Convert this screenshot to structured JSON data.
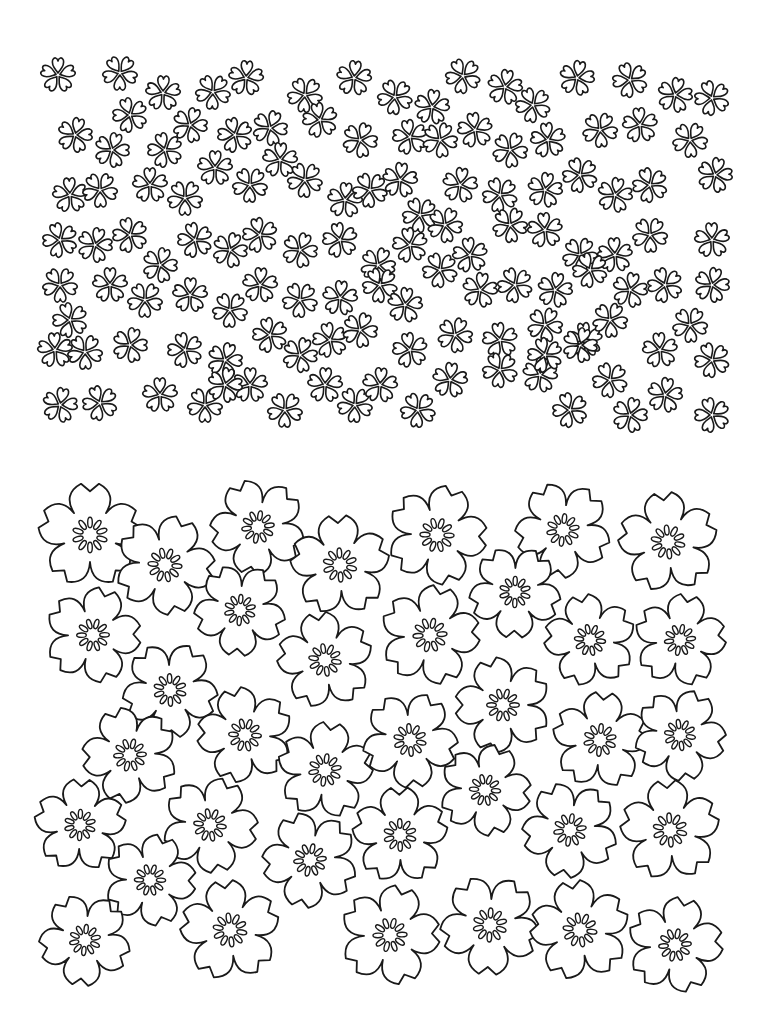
{
  "page": {
    "width": 770,
    "height": 1033,
    "background": "#ffffff",
    "stroke": "#1a1a1a"
  },
  "small_blossoms": {
    "region": {
      "x": 35,
      "y": 55,
      "width": 700,
      "height": 385
    },
    "size": 17,
    "positions": [
      [
        58,
        75
      ],
      [
        120,
        73
      ],
      [
        163,
        93
      ],
      [
        213,
        92
      ],
      [
        246,
        78
      ],
      [
        305,
        95
      ],
      [
        354,
        78
      ],
      [
        395,
        97
      ],
      [
        432,
        107
      ],
      [
        463,
        76
      ],
      [
        505,
        87
      ],
      [
        533,
        105
      ],
      [
        577,
        78
      ],
      [
        630,
        80
      ],
      [
        675,
        95
      ],
      [
        712,
        98
      ],
      [
        75,
        135
      ],
      [
        130,
        115
      ],
      [
        112,
        150
      ],
      [
        165,
        150
      ],
      [
        190,
        125
      ],
      [
        235,
        135
      ],
      [
        270,
        128
      ],
      [
        320,
        120
      ],
      [
        360,
        140
      ],
      [
        410,
        137
      ],
      [
        440,
        140
      ],
      [
        475,
        130
      ],
      [
        510,
        150
      ],
      [
        548,
        140
      ],
      [
        600,
        130
      ],
      [
        640,
        125
      ],
      [
        690,
        140
      ],
      [
        70,
        195
      ],
      [
        100,
        190
      ],
      [
        150,
        185
      ],
      [
        185,
        198
      ],
      [
        215,
        168
      ],
      [
        250,
        185
      ],
      [
        280,
        160
      ],
      [
        305,
        180
      ],
      [
        345,
        200
      ],
      [
        370,
        190
      ],
      [
        400,
        180
      ],
      [
        420,
        215
      ],
      [
        460,
        185
      ],
      [
        500,
        195
      ],
      [
        545,
        190
      ],
      [
        580,
        175
      ],
      [
        615,
        195
      ],
      [
        650,
        185
      ],
      [
        715,
        175
      ],
      [
        60,
        240
      ],
      [
        95,
        245
      ],
      [
        130,
        235
      ],
      [
        160,
        265
      ],
      [
        195,
        240
      ],
      [
        230,
        250
      ],
      [
        260,
        235
      ],
      [
        300,
        250
      ],
      [
        340,
        240
      ],
      [
        378,
        265
      ],
      [
        410,
        245
      ],
      [
        445,
        225
      ],
      [
        470,
        255
      ],
      [
        510,
        225
      ],
      [
        545,
        230
      ],
      [
        580,
        255
      ],
      [
        615,
        255
      ],
      [
        650,
        235
      ],
      [
        712,
        240
      ],
      [
        60,
        285
      ],
      [
        110,
        285
      ],
      [
        145,
        300
      ],
      [
        190,
        295
      ],
      [
        230,
        310
      ],
      [
        260,
        285
      ],
      [
        300,
        300
      ],
      [
        340,
        298
      ],
      [
        380,
        285
      ],
      [
        405,
        305
      ],
      [
        440,
        270
      ],
      [
        480,
        290
      ],
      [
        515,
        285
      ],
      [
        555,
        290
      ],
      [
        590,
        270
      ],
      [
        630,
        290
      ],
      [
        665,
        285
      ],
      [
        712,
        285
      ],
      [
        70,
        320
      ],
      [
        130,
        345
      ],
      [
        185,
        350
      ],
      [
        225,
        360
      ],
      [
        270,
        335
      ],
      [
        300,
        355
      ],
      [
        330,
        340
      ],
      [
        360,
        330
      ],
      [
        410,
        350
      ],
      [
        455,
        335
      ],
      [
        500,
        340
      ],
      [
        545,
        325
      ],
      [
        585,
        340
      ],
      [
        610,
        320
      ],
      [
        660,
        350
      ],
      [
        690,
        325
      ],
      [
        55,
        350
      ],
      [
        85,
        352
      ],
      [
        160,
        395
      ],
      [
        205,
        405
      ],
      [
        250,
        385
      ],
      [
        285,
        410
      ],
      [
        325,
        385
      ],
      [
        355,
        405
      ],
      [
        380,
        385
      ],
      [
        418,
        410
      ],
      [
        450,
        380
      ],
      [
        500,
        370
      ],
      [
        540,
        375
      ],
      [
        610,
        380
      ],
      [
        665,
        395
      ],
      [
        712,
        360
      ],
      [
        60,
        405
      ],
      [
        100,
        403
      ],
      [
        225,
        385
      ],
      [
        570,
        410
      ],
      [
        630,
        415
      ],
      [
        712,
        415
      ],
      [
        580,
        345
      ],
      [
        545,
        355
      ]
    ]
  },
  "large_blossoms": {
    "region": {
      "x": 40,
      "y": 480,
      "width": 690,
      "height": 535
    },
    "positions": [
      [
        90,
        535,
        52
      ],
      [
        165,
        565,
        50
      ],
      [
        258,
        527,
        48
      ],
      [
        340,
        565,
        50
      ],
      [
        437,
        535,
        50
      ],
      [
        563,
        530,
        48
      ],
      [
        668,
        542,
        50
      ],
      [
        93,
        635,
        48
      ],
      [
        240,
        610,
        46
      ],
      [
        325,
        660,
        48
      ],
      [
        430,
        635,
        50
      ],
      [
        515,
        592,
        46
      ],
      [
        590,
        640,
        46
      ],
      [
        680,
        640,
        46
      ],
      [
        170,
        690,
        48
      ],
      [
        245,
        735,
        48
      ],
      [
        325,
        770,
        48
      ],
      [
        410,
        740,
        48
      ],
      [
        503,
        705,
        48
      ],
      [
        600,
        740,
        48
      ],
      [
        680,
        735,
        46
      ],
      [
        130,
        755,
        48
      ],
      [
        80,
        825,
        46
      ],
      [
        210,
        825,
        48
      ],
      [
        310,
        860,
        48
      ],
      [
        400,
        835,
        48
      ],
      [
        485,
        790,
        46
      ],
      [
        570,
        830,
        48
      ],
      [
        670,
        830,
        50
      ],
      [
        150,
        880,
        46
      ],
      [
        85,
        940,
        46
      ],
      [
        230,
        930,
        50
      ],
      [
        390,
        935,
        50
      ],
      [
        490,
        925,
        50
      ],
      [
        580,
        930,
        50
      ],
      [
        675,
        945,
        48
      ]
    ]
  }
}
